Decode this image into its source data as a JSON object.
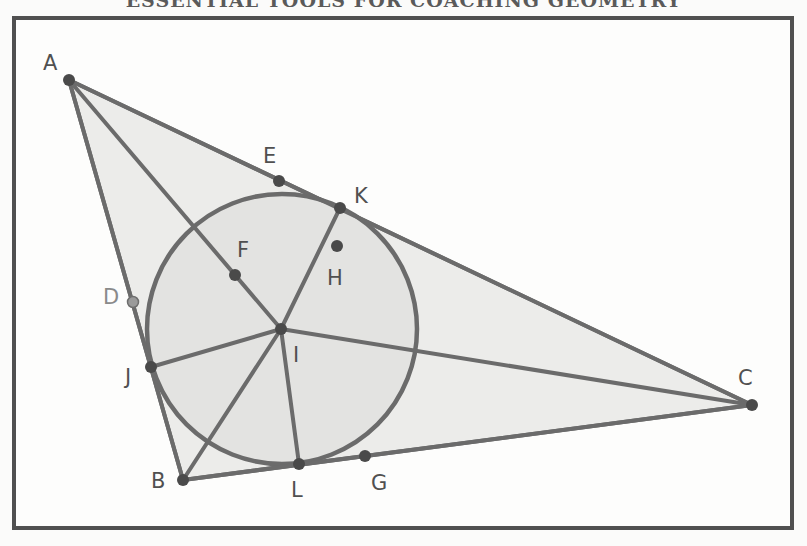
{
  "title": "ESSENTIAL TOOLS FOR COACHING GEOMETRY",
  "colors": {
    "frame": "#505050",
    "stroke": "#6b6b6b",
    "fill_triangle": "#ececea",
    "fill_circle": "#e3e3e1",
    "point": "#4a4a4a",
    "point_light": "#9a9a9a",
    "label": "#505050",
    "label_light": "#8a8a8a"
  },
  "diagram": {
    "triangle": [
      "A",
      "B",
      "C"
    ],
    "incircle": {
      "center": "I",
      "cx": 282,
      "cy": 329,
      "r": 135
    },
    "points": [
      {
        "name": "A",
        "x": 69,
        "y": 80,
        "label_dx": -26,
        "label_dy": -10,
        "style": "dark"
      },
      {
        "name": "B",
        "x": 183,
        "y": 480,
        "label_dx": -32,
        "label_dy": 8,
        "style": "dark"
      },
      {
        "name": "C",
        "x": 752,
        "y": 405,
        "label_dx": -14,
        "label_dy": -20,
        "style": "dark"
      },
      {
        "name": "D",
        "x": 133,
        "y": 302,
        "label_dx": -30,
        "label_dy": 2,
        "style": "light"
      },
      {
        "name": "E",
        "x": 279,
        "y": 181,
        "label_dx": -16,
        "label_dy": -18,
        "style": "dark"
      },
      {
        "name": "F",
        "x": 235,
        "y": 275,
        "label_dx": 2,
        "label_dy": -18,
        "style": "dark"
      },
      {
        "name": "G",
        "x": 365,
        "y": 456,
        "label_dx": 6,
        "label_dy": 34,
        "style": "dark"
      },
      {
        "name": "H",
        "x": 337,
        "y": 246,
        "label_dx": -10,
        "label_dy": 39,
        "style": "dark"
      },
      {
        "name": "I",
        "x": 281,
        "y": 329,
        "label_dx": 12,
        "label_dy": 33,
        "style": "dark"
      },
      {
        "name": "J",
        "x": 151,
        "y": 367,
        "label_dx": -26,
        "label_dy": 17,
        "style": "dark"
      },
      {
        "name": "K",
        "x": 340,
        "y": 208,
        "label_dx": 14,
        "label_dy": -5,
        "style": "dark"
      },
      {
        "name": "L",
        "x": 299,
        "y": 464,
        "label_dx": -8,
        "label_dy": 33,
        "style": "dark"
      }
    ],
    "segments": [
      [
        "A",
        "B"
      ],
      [
        "B",
        "C"
      ],
      [
        "C",
        "A"
      ],
      [
        "A",
        "I"
      ],
      [
        "B",
        "I"
      ],
      [
        "C",
        "I"
      ],
      [
        "I",
        "J"
      ],
      [
        "I",
        "K"
      ],
      [
        "I",
        "L"
      ]
    ]
  }
}
